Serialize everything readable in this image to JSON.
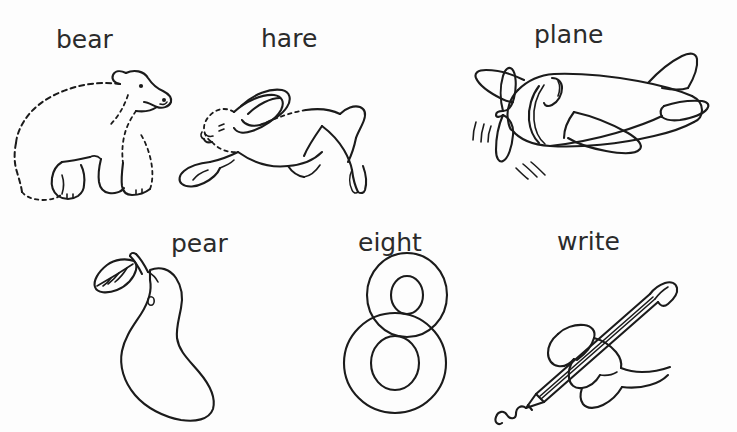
{
  "page": {
    "background_color": "#fdfdfd",
    "ink_color": "#1b1b1b",
    "label_color": "#2b2b2b",
    "width": 737,
    "height": 432
  },
  "rows": [
    {
      "row_index": 1,
      "items": [
        {
          "label": "bear",
          "icon": "bear-line-drawing",
          "description": "line drawing of a bear standing in profile facing right"
        },
        {
          "label": "hare",
          "icon": "hare-line-drawing",
          "description": "line drawing of a hare leaping to the left with ears swept back"
        },
        {
          "label": "plane",
          "icon": "plane-line-drawing",
          "description": "line drawing of a propeller airplane facing left with motion lines"
        }
      ]
    },
    {
      "row_index": 2,
      "items": [
        {
          "label": "pear",
          "icon": "pear-line-drawing",
          "description": "line drawing of a pear with a leaf and stem at the top left"
        },
        {
          "label": "eight",
          "icon": "eight-numeral-outline",
          "description": "outline drawing of the numeral 8"
        },
        {
          "label": "write",
          "icon": "writing-hand-line-drawing",
          "description": "line drawing of a hand holding a pencil drawing a squiggly line"
        }
      ]
    }
  ]
}
